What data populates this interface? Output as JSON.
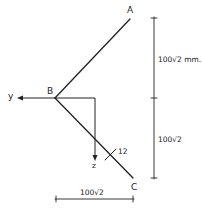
{
  "diagram": {
    "points": {
      "A": {
        "label": "A",
        "x": 131,
        "y": 20
      },
      "B": {
        "label": "B",
        "x": 55,
        "y": 98
      },
      "C": {
        "label": "C",
        "x": 133,
        "y": 178
      }
    },
    "axes": {
      "y": {
        "label": "y"
      },
      "z": {
        "label": "z"
      }
    },
    "annotations": {
      "angle_mark": "12"
    },
    "dimensions": {
      "vertical_upper": "100√2 mm.",
      "vertical_lower": "100√2",
      "horizontal": "100√2"
    },
    "colors": {
      "ink": "#222222",
      "background": "#ffffff"
    }
  }
}
